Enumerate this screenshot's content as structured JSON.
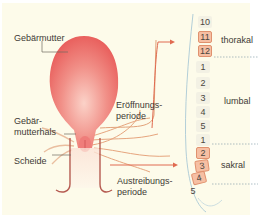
{
  "labels": {
    "uterus": "Gebärmutter",
    "cervix_line1": "Gebär-",
    "cervix_line2": "mutterhals",
    "vagina": "Scheide",
    "opening_line1": "Eröffnungs-",
    "opening_line2": "periode",
    "expulsion_line1": "Austreibungs-",
    "expulsion_line2": "periode"
  },
  "regions": {
    "thoracic": "thorakal",
    "lumbar": "lumbal",
    "sacral": "sakral"
  },
  "vertebrae": [
    {
      "n": "10",
      "region": "thoracic",
      "highlight": false
    },
    {
      "n": "11",
      "region": "thoracic",
      "highlight": true
    },
    {
      "n": "12",
      "region": "thoracic",
      "highlight": true
    },
    {
      "n": "1",
      "region": "lumbar",
      "highlight": false
    },
    {
      "n": "2",
      "region": "lumbar",
      "highlight": false
    },
    {
      "n": "3",
      "region": "lumbar",
      "highlight": false
    },
    {
      "n": "4",
      "region": "lumbar",
      "highlight": false
    },
    {
      "n": "5",
      "region": "lumbar",
      "highlight": false
    },
    {
      "n": "1",
      "region": "sacral",
      "highlight": false
    },
    {
      "n": "2",
      "region": "sacral",
      "highlight": true
    },
    {
      "n": "3",
      "region": "sacral",
      "highlight": true
    },
    {
      "n": "4",
      "region": "sacral",
      "highlight": true
    },
    {
      "n": "5",
      "region": "sacral",
      "highlight": false
    }
  ],
  "colors": {
    "background": "#fdfbea",
    "uterus": "#ee7b74",
    "highlight": "#f6bfa3",
    "nerve": "#e2a27a",
    "arrow": "#e06a50",
    "spine_line": "#9fc3d3"
  }
}
